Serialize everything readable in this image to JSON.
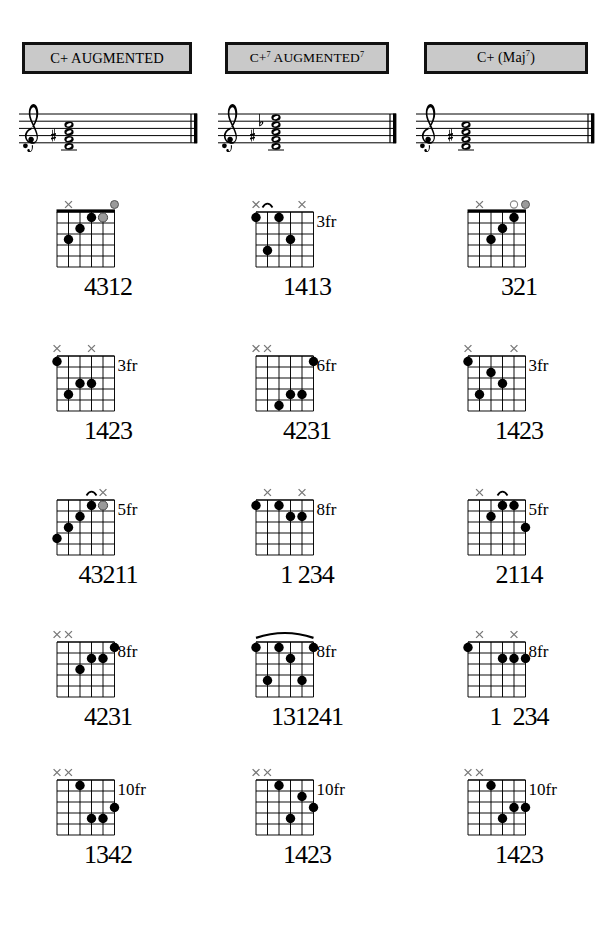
{
  "page": {
    "columns": 3,
    "rows_per_column": 5,
    "background": "#ffffff",
    "header_fill": "#c9c9c9",
    "header_border": "#111111",
    "dot_color": "#000000",
    "open_ring_color": "#ffffff",
    "gray_dot_color": "#9a9a9a",
    "mute_x_color": "#7a7a7a"
  },
  "columns": [
    {
      "id": "c-augmented",
      "header": {
        "text": "C+ AUGMENTED",
        "parts": [
          {
            "text": "C+ AUGMENTED",
            "sup": ""
          }
        ]
      },
      "staff": {
        "clef": "treble",
        "accidentals": [
          "sharp"
        ],
        "notes": [
          "C",
          "E",
          "G#"
        ],
        "chord_stack": 3,
        "barline": "final"
      },
      "shapes": [
        {
          "fingering": "4312",
          "fret_label": "",
          "markers": [
            "",
            "x",
            "",
            "",
            "",
            "open-gray"
          ],
          "top_marks": [
            {
              "string": 1,
              "type": "mute"
            },
            {
              "string": 5,
              "type": "gray-circle"
            }
          ],
          "nut": true,
          "barre": null,
          "dots": [
            {
              "string": 1,
              "fret": 3,
              "style": "filled"
            },
            {
              "string": 2,
              "fret": 2,
              "style": "filled"
            },
            {
              "string": 3,
              "fret": 1,
              "style": "filled"
            },
            {
              "string": 4,
              "fret": 1,
              "style": "gray"
            }
          ]
        },
        {
          "fingering": "1423",
          "fret_label": "3fr",
          "top_marks": [
            {
              "string": 0,
              "type": "mute"
            },
            {
              "string": 3,
              "type": "mute"
            }
          ],
          "nut": false,
          "barre": null,
          "dots": [
            {
              "string": 0,
              "fret": 1,
              "style": "filled"
            },
            {
              "string": 2,
              "fret": 3,
              "style": "filled"
            },
            {
              "string": 3,
              "fret": 3,
              "style": "filled"
            },
            {
              "string": 1,
              "fret": 4,
              "style": "filled"
            }
          ]
        },
        {
          "fingering": "43211",
          "fret_label": "5fr",
          "top_marks": [
            {
              "string": 3,
              "type": "arc"
            },
            {
              "string": 4,
              "type": "mute"
            }
          ],
          "nut": false,
          "barre": null,
          "dots": [
            {
              "string": 3,
              "fret": 1,
              "style": "filled"
            },
            {
              "string": 4,
              "fret": 1,
              "style": "gray"
            },
            {
              "string": 2,
              "fret": 2,
              "style": "filled"
            },
            {
              "string": 1,
              "fret": 3,
              "style": "filled"
            },
            {
              "string": 0,
              "fret": 4,
              "style": "filled"
            }
          ]
        },
        {
          "fingering": "4231",
          "fret_label": "8fr",
          "top_marks": [
            {
              "string": 0,
              "type": "mute"
            },
            {
              "string": 1,
              "type": "mute"
            }
          ],
          "nut": false,
          "barre": null,
          "dots": [
            {
              "string": 5,
              "fret": 1,
              "style": "filled"
            },
            {
              "string": 3,
              "fret": 2,
              "style": "filled"
            },
            {
              "string": 4,
              "fret": 2,
              "style": "filled"
            },
            {
              "string": 2,
              "fret": 3,
              "style": "filled"
            }
          ]
        },
        {
          "fingering": "1342",
          "fret_label": "10fr",
          "top_marks": [
            {
              "string": 0,
              "type": "mute"
            },
            {
              "string": 1,
              "type": "mute"
            }
          ],
          "nut": false,
          "barre": null,
          "dots": [
            {
              "string": 2,
              "fret": 1,
              "style": "filled"
            },
            {
              "string": 5,
              "fret": 3,
              "style": "filled"
            },
            {
              "string": 3,
              "fret": 4,
              "style": "filled"
            },
            {
              "string": 4,
              "fret": 4,
              "style": "filled"
            }
          ]
        }
      ]
    },
    {
      "id": "c7-augmented-7",
      "header": {
        "text": "C+7 AUGMENTED 7",
        "parts": [
          {
            "text": "C+",
            "sup": "7"
          },
          {
            "text": " AUGMENTED",
            "sup": "7"
          }
        ]
      },
      "staff": {
        "clef": "treble",
        "accidentals": [
          "sharp",
          "flat"
        ],
        "notes": [
          "C",
          "E",
          "G#",
          "Bb"
        ],
        "chord_stack": 4,
        "barline": "final"
      },
      "shapes": [
        {
          "fingering": "1413",
          "fret_label": "3fr",
          "top_marks": [
            {
              "string": 0,
              "type": "mute"
            },
            {
              "string": 1,
              "type": "arc"
            },
            {
              "string": 4,
              "type": "mute"
            }
          ],
          "nut": false,
          "barre": null,
          "dots": [
            {
              "string": 0,
              "fret": 1,
              "style": "filled"
            },
            {
              "string": 2,
              "fret": 1,
              "style": "filled"
            },
            {
              "string": 3,
              "fret": 3,
              "style": "filled"
            },
            {
              "string": 1,
              "fret": 4,
              "style": "filled"
            }
          ]
        },
        {
          "fingering": "4231",
          "fret_label": "6fr",
          "top_marks": [
            {
              "string": 0,
              "type": "mute"
            },
            {
              "string": 1,
              "type": "mute"
            }
          ],
          "nut": false,
          "barre": null,
          "dots": [
            {
              "string": 5,
              "fret": 1,
              "style": "filled"
            },
            {
              "string": 3,
              "fret": 4,
              "style": "filled"
            },
            {
              "string": 4,
              "fret": 4,
              "style": "filled"
            },
            {
              "string": 2,
              "fret": 5,
              "style": "filled"
            }
          ]
        },
        {
          "fingering": "1 234",
          "fret_label": "8fr",
          "top_marks": [
            {
              "string": 1,
              "type": "mute"
            },
            {
              "string": 4,
              "type": "mute"
            }
          ],
          "nut": false,
          "barre": null,
          "dots": [
            {
              "string": 0,
              "fret": 1,
              "style": "filled"
            },
            {
              "string": 2,
              "fret": 1,
              "style": "filled"
            },
            {
              "string": 3,
              "fret": 2,
              "style": "filled"
            },
            {
              "string": 4,
              "fret": 2,
              "style": "filled"
            }
          ]
        },
        {
          "fingering": "131241",
          "fret_label": "8fr",
          "top_marks": [
            {
              "string": 0,
              "type": "full-arc"
            }
          ],
          "nut": false,
          "barre": {
            "from": 0,
            "to": 5,
            "fret": 1
          },
          "dots": [
            {
              "string": 0,
              "fret": 1,
              "style": "filled"
            },
            {
              "string": 2,
              "fret": 1,
              "style": "filled"
            },
            {
              "string": 5,
              "fret": 1,
              "style": "filled"
            },
            {
              "string": 3,
              "fret": 2,
              "style": "filled"
            },
            {
              "string": 1,
              "fret": 4,
              "style": "filled"
            },
            {
              "string": 4,
              "fret": 4,
              "style": "filled"
            }
          ]
        },
        {
          "fingering": "1423",
          "fret_label": "10fr",
          "top_marks": [
            {
              "string": 0,
              "type": "mute"
            },
            {
              "string": 1,
              "type": "mute"
            }
          ],
          "nut": false,
          "barre": null,
          "dots": [
            {
              "string": 2,
              "fret": 1,
              "style": "filled"
            },
            {
              "string": 4,
              "fret": 2,
              "style": "filled"
            },
            {
              "string": 5,
              "fret": 3,
              "style": "filled"
            },
            {
              "string": 3,
              "fret": 4,
              "style": "filled"
            }
          ]
        }
      ]
    },
    {
      "id": "c-maj7-augmented",
      "header": {
        "text": "C+ (Maj7)",
        "parts": [
          {
            "text": "C+ (Maj",
            "sup": "7"
          },
          {
            "text": ")",
            "sup": ""
          }
        ]
      },
      "staff": {
        "clef": "treble",
        "accidentals": [
          "sharp"
        ],
        "notes": [
          "C",
          "E",
          "G#",
          "B"
        ],
        "chord_stack": 3,
        "barline": "final"
      },
      "shapes": [
        {
          "fingering": "321",
          "fret_label": "",
          "top_marks": [
            {
              "string": 1,
              "type": "mute"
            },
            {
              "string": 4,
              "type": "open"
            },
            {
              "string": 5,
              "type": "gray-circle"
            }
          ],
          "nut": true,
          "barre": null,
          "dots": [
            {
              "string": 4,
              "fret": 1,
              "style": "filled"
            },
            {
              "string": 3,
              "fret": 2,
              "style": "filled"
            },
            {
              "string": 2,
              "fret": 3,
              "style": "filled"
            }
          ]
        },
        {
          "fingering": "1423",
          "fret_label": "3fr",
          "top_marks": [
            {
              "string": 0,
              "type": "mute"
            },
            {
              "string": 4,
              "type": "mute"
            }
          ],
          "nut": false,
          "barre": null,
          "dots": [
            {
              "string": 0,
              "fret": 1,
              "style": "filled"
            },
            {
              "string": 2,
              "fret": 2,
              "style": "filled"
            },
            {
              "string": 3,
              "fret": 3,
              "style": "filled"
            },
            {
              "string": 1,
              "fret": 4,
              "style": "filled"
            }
          ]
        },
        {
          "fingering": "2114",
          "fret_label": "5fr",
          "top_marks": [
            {
              "string": 1,
              "type": "mute"
            },
            {
              "string": 3,
              "type": "arc"
            }
          ],
          "nut": false,
          "barre": null,
          "dots": [
            {
              "string": 3,
              "fret": 1,
              "style": "filled"
            },
            {
              "string": 4,
              "fret": 1,
              "style": "filled"
            },
            {
              "string": 2,
              "fret": 2,
              "style": "filled"
            },
            {
              "string": 5,
              "fret": 3,
              "style": "filled"
            }
          ]
        },
        {
          "fingering": "1  234",
          "fret_label": "8fr",
          "top_marks": [
            {
              "string": 1,
              "type": "mute"
            },
            {
              "string": 4,
              "type": "mute"
            }
          ],
          "nut": false,
          "barre": null,
          "dots": [
            {
              "string": 0,
              "fret": 1,
              "style": "filled"
            },
            {
              "string": 3,
              "fret": 2,
              "style": "filled"
            },
            {
              "string": 4,
              "fret": 2,
              "style": "filled"
            },
            {
              "string": 5,
              "fret": 2,
              "style": "filled"
            }
          ]
        },
        {
          "fingering": "1423",
          "fret_label": "10fr",
          "top_marks": [
            {
              "string": 0,
              "type": "mute"
            },
            {
              "string": 1,
              "type": "mute"
            }
          ],
          "nut": false,
          "barre": null,
          "dots": [
            {
              "string": 2,
              "fret": 1,
              "style": "filled"
            },
            {
              "string": 4,
              "fret": 3,
              "style": "filled"
            },
            {
              "string": 5,
              "fret": 3,
              "style": "filled"
            },
            {
              "string": 3,
              "fret": 4,
              "style": "filled"
            }
          ]
        }
      ]
    }
  ]
}
